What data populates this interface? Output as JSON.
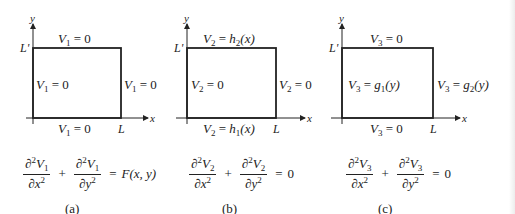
{
  "panels": [
    {
      "id": "a",
      "caption": "(a)",
      "axis_x": "x",
      "axis_y": "y",
      "tick_x": "L",
      "tick_y": "L'",
      "func": "V",
      "index": "1",
      "top": {
        "lhs": "V",
        "sub": "1",
        "eq": "=",
        "rhs_func": "0",
        "rhs_sub": "",
        "rhs_arg": ""
      },
      "bottom": {
        "lhs": "V",
        "sub": "1",
        "eq": "=",
        "rhs_func": "0",
        "rhs_sub": "",
        "rhs_arg": ""
      },
      "left": {
        "lhs": "V",
        "sub": "1",
        "eq": "=",
        "rhs_func": "0",
        "rhs_sub": "",
        "rhs_arg": ""
      },
      "right": {
        "lhs": "V",
        "sub": "1",
        "eq": "=",
        "rhs_func": "0",
        "rhs_sub": "",
        "rhs_arg": ""
      },
      "equation": {
        "d": "∂",
        "num_v": "V",
        "sub": "1",
        "den1": "∂x",
        "den2": "∂y",
        "plus": "+",
        "equals": "=",
        "rhs": "F(x, y)"
      }
    },
    {
      "id": "b",
      "caption": "(b)",
      "axis_x": "x",
      "axis_y": "y",
      "tick_x": "L",
      "tick_y": "L'",
      "func": "V",
      "index": "2",
      "top": {
        "lhs": "V",
        "sub": "2",
        "eq": "=",
        "rhs_func": "h",
        "rhs_sub": "2",
        "rhs_arg": "(x)"
      },
      "bottom": {
        "lhs": "V",
        "sub": "2",
        "eq": "=",
        "rhs_func": "h",
        "rhs_sub": "1",
        "rhs_arg": "(x)"
      },
      "left": {
        "lhs": "V",
        "sub": "2",
        "eq": "=",
        "rhs_func": "0",
        "rhs_sub": "",
        "rhs_arg": ""
      },
      "right": {
        "lhs": "V",
        "sub": "2",
        "eq": "=",
        "rhs_func": "0",
        "rhs_sub": "",
        "rhs_arg": ""
      },
      "equation": {
        "d": "∂",
        "num_v": "V",
        "sub": "2",
        "den1": "∂x",
        "den2": "∂y",
        "plus": "+",
        "equals": "=",
        "rhs": "0"
      }
    },
    {
      "id": "c",
      "caption": "(c)",
      "axis_x": "x",
      "axis_y": "y",
      "tick_x": "L",
      "tick_y": "L'",
      "func": "V",
      "index": "3",
      "top": {
        "lhs": "V",
        "sub": "3",
        "eq": "=",
        "rhs_func": "0",
        "rhs_sub": "",
        "rhs_arg": ""
      },
      "bottom": {
        "lhs": "V",
        "sub": "3",
        "eq": "=",
        "rhs_func": "0",
        "rhs_sub": "",
        "rhs_arg": ""
      },
      "left": {
        "lhs": "V",
        "sub": "3",
        "eq": "=",
        "rhs_func": "g",
        "rhs_sub": "1",
        "rhs_arg": "(y)"
      },
      "right": {
        "lhs": "V",
        "sub": "3",
        "eq": "=",
        "rhs_func": "g",
        "rhs_sub": "2",
        "rhs_arg": "(y)"
      },
      "equation": {
        "d": "∂",
        "num_v": "V",
        "sub": "3",
        "den1": "∂x",
        "den2": "∂y",
        "plus": "+",
        "equals": "=",
        "rhs": "0"
      }
    }
  ],
  "colors": {
    "ink": "#222222",
    "background": "#ffffff"
  }
}
